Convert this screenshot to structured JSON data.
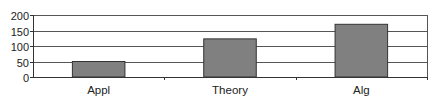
{
  "chart_data": {
    "type": "bar",
    "title": "",
    "xlabel": "",
    "ylabel": "",
    "categories": [
      "Appl",
      "Theory",
      "Alg"
    ],
    "values": [
      50,
      123,
      170
    ],
    "ylim": [
      0,
      200
    ],
    "yticks": [
      0,
      50,
      100,
      150,
      200
    ],
    "grid": true,
    "legend": "none",
    "bar_color": "#808080",
    "bar_edge_color": "#333333",
    "grid_color": "#555555",
    "background": "#ffffff"
  }
}
